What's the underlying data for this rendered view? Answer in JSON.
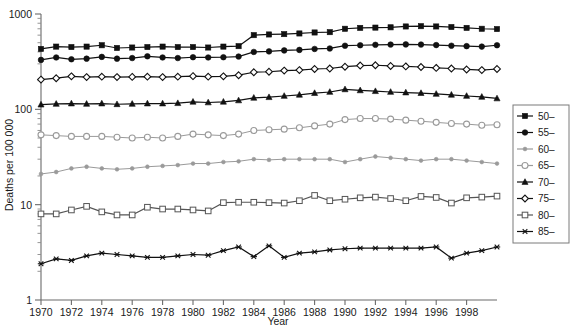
{
  "chart_data": {
    "type": "line",
    "title": "",
    "xlabel": "Year",
    "ylabel": "Deaths per 100 000",
    "yscale": "log",
    "ylim": [
      1,
      1000
    ],
    "xlim": [
      1970,
      2000
    ],
    "grid": false,
    "legend_position": "right-outside",
    "y_tick_labels": [
      "1000",
      "100",
      "10",
      "1"
    ],
    "y_tick_values": [
      1000,
      100,
      10,
      1
    ],
    "x_tick_labels": [
      "1970",
      "1972",
      "1974",
      "1976",
      "1978",
      "1980",
      "1982",
      "1984",
      "1986",
      "1988",
      "1990",
      "1992",
      "1994",
      "1996",
      "1998"
    ],
    "x_tick_values": [
      1970,
      1972,
      1974,
      1976,
      1978,
      1980,
      1982,
      1984,
      1986,
      1988,
      1990,
      1992,
      1994,
      1996,
      1998
    ],
    "x": [
      1970,
      1971,
      1972,
      1973,
      1974,
      1975,
      1976,
      1977,
      1978,
      1979,
      1980,
      1981,
      1982,
      1983,
      1984,
      1985,
      1986,
      1987,
      1988,
      1989,
      1990,
      1991,
      1992,
      1993,
      1994,
      1995,
      1996,
      1997,
      1998,
      1999,
      2000
    ],
    "series": [
      {
        "name": "50-",
        "label": "50–",
        "marker": "filled-square",
        "color": "#111111",
        "values": [
          430,
          455,
          450,
          455,
          470,
          440,
          445,
          450,
          455,
          450,
          450,
          445,
          455,
          460,
          600,
          610,
          615,
          625,
          640,
          645,
          700,
          715,
          720,
          725,
          740,
          745,
          740,
          730,
          715,
          700,
          695
        ]
      },
      {
        "name": "55-",
        "label": "55–",
        "marker": "filled-circle",
        "color": "#111111",
        "values": [
          330,
          350,
          335,
          340,
          355,
          340,
          345,
          360,
          350,
          345,
          352,
          350,
          352,
          358,
          400,
          405,
          415,
          420,
          430,
          435,
          465,
          470,
          475,
          478,
          480,
          478,
          472,
          465,
          460,
          455,
          470
        ]
      },
      {
        "name": "75-",
        "label": "75–",
        "marker": "open-diamond",
        "color": "#111111",
        "values": [
          205,
          212,
          222,
          218,
          220,
          218,
          219,
          220,
          218,
          220,
          223,
          220,
          222,
          228,
          245,
          248,
          255,
          258,
          265,
          268,
          280,
          288,
          290,
          285,
          282,
          278,
          272,
          268,
          262,
          258,
          265
        ]
      },
      {
        "name": "70-",
        "label": "70–",
        "marker": "filled-triangle",
        "color": "#111111",
        "values": [
          112,
          114,
          115,
          114,
          115,
          113,
          114,
          115,
          115,
          116,
          120,
          118,
          120,
          124,
          132,
          134,
          138,
          142,
          148,
          152,
          162,
          158,
          155,
          152,
          150,
          148,
          145,
          142,
          138,
          135,
          130
        ]
      },
      {
        "name": "65-",
        "label": "65–",
        "marker": "gray-open-circle",
        "color": "#9a9a9a",
        "values": [
          54,
          53,
          52,
          52,
          52,
          51,
          50,
          51,
          50,
          52,
          55,
          54,
          53,
          55,
          60,
          61,
          62,
          64,
          67,
          70,
          78,
          80,
          80,
          79,
          77,
          75,
          73,
          71,
          70,
          68,
          69
        ]
      },
      {
        "name": "60-",
        "label": "60–",
        "marker": "gray-dot",
        "color": "#9a9a9a",
        "values": [
          21,
          22,
          24,
          25,
          24,
          23.5,
          24,
          25,
          25.5,
          26,
          27,
          27,
          28,
          28.5,
          30,
          29.5,
          30,
          30,
          30,
          30,
          28,
          30,
          32,
          31,
          30,
          29,
          30,
          30,
          29,
          28,
          27
        ]
      },
      {
        "name": "80-",
        "label": "80–",
        "marker": "open-square",
        "color": "#555555",
        "values": [
          8.0,
          8.0,
          8.8,
          9.6,
          8.4,
          7.8,
          7.8,
          9.4,
          9.0,
          9.0,
          8.8,
          8.6,
          10.5,
          10.6,
          10.6,
          10.5,
          10.4,
          11.0,
          12.5,
          11.0,
          11.4,
          11.8,
          12.0,
          11.6,
          11.0,
          12.2,
          11.9,
          10.4,
          11.8,
          12.0,
          12.3
        ]
      },
      {
        "name": "85-",
        "label": "85–",
        "marker": "star",
        "color": "#111111",
        "values": [
          2.4,
          2.7,
          2.6,
          2.9,
          3.1,
          3.0,
          2.9,
          2.8,
          2.8,
          2.9,
          3.0,
          2.95,
          3.3,
          3.6,
          2.85,
          3.7,
          2.8,
          3.1,
          3.2,
          3.35,
          3.45,
          3.5,
          3.5,
          3.5,
          3.5,
          3.5,
          3.6,
          2.75,
          3.1,
          3.3,
          3.6
        ]
      }
    ],
    "legend_entries": [
      {
        "label": "50–",
        "marker": "filled-square",
        "color": "#111111"
      },
      {
        "label": "55–",
        "marker": "filled-circle",
        "color": "#111111"
      },
      {
        "label": "60–",
        "marker": "gray-dot",
        "color": "#9a9a9a"
      },
      {
        "label": "65–",
        "marker": "gray-open-circle",
        "color": "#9a9a9a"
      },
      {
        "label": "70–",
        "marker": "filled-triangle",
        "color": "#111111"
      },
      {
        "label": "75–",
        "marker": "open-diamond",
        "color": "#111111"
      },
      {
        "label": "80–",
        "marker": "open-square",
        "color": "#555555"
      },
      {
        "label": "85–",
        "marker": "star",
        "color": "#111111"
      }
    ]
  }
}
